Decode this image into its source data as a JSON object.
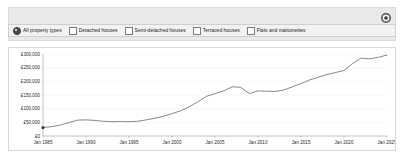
{
  "toolbar": {
    "settings_icon": "gear-icon"
  },
  "filters": {
    "options": [
      {
        "label": "All property types",
        "control": "radio",
        "checked": true
      },
      {
        "label": "Detached houses",
        "control": "checkbox",
        "checked": false
      },
      {
        "label": "Semi-detached houses",
        "control": "checkbox",
        "checked": false
      },
      {
        "label": "Terraced houses",
        "control": "checkbox",
        "checked": false
      },
      {
        "label": "Flats and maisonettes",
        "control": "checkbox",
        "checked": false
      }
    ]
  },
  "colors": {
    "line": "#555555",
    "toolbar_bg": "#e9e9e9",
    "filter_bg": "#f2f2f2",
    "panel_border": "#d8d8d8",
    "grid": "#ededed",
    "axis": "#9a9a9a"
  },
  "chart_data": {
    "type": "line",
    "title": "",
    "xlabel": "",
    "ylabel": "",
    "grid": true,
    "legend": false,
    "ylim": [
      0,
      300000
    ],
    "yticks": [
      0,
      50000,
      100000,
      150000,
      200000,
      250000,
      300000
    ],
    "ytick_labels": [
      "£0",
      "£50,000",
      "£100,000",
      "£150,000",
      "£200,000",
      "£250,000",
      "£300,000"
    ],
    "xlim": [
      "1985-01",
      "2025-01"
    ],
    "xticks": [
      "Jan 1985",
      "Jan 1990",
      "Jan 1995",
      "Jan 2000",
      "Jan 2005",
      "Jan 2010",
      "Jan 2015",
      "Jan 2020",
      "Jan 2025"
    ],
    "series": [
      {
        "name": "All property types",
        "x": [
          "1985",
          "1986",
          "1987",
          "1988",
          "1989",
          "1990",
          "1991",
          "1992",
          "1993",
          "1994",
          "1995",
          "1996",
          "1997",
          "1998",
          "1999",
          "2000",
          "2001",
          "2002",
          "2003",
          "2004",
          "2005",
          "2006",
          "2007",
          "2008",
          "2009",
          "2010",
          "2011",
          "2012",
          "2013",
          "2014",
          "2015",
          "2016",
          "2017",
          "2018",
          "2019",
          "2020",
          "2021",
          "2022",
          "2023",
          "2024",
          "2025"
        ],
        "values": [
          31000,
          34000,
          40000,
          49000,
          58000,
          59000,
          57000,
          54000,
          52000,
          53000,
          52000,
          54000,
          59000,
          65000,
          72000,
          82000,
          92000,
          107000,
          125000,
          145000,
          155000,
          165000,
          180000,
          178000,
          155000,
          165000,
          164000,
          163000,
          168000,
          180000,
          192000,
          205000,
          215000,
          225000,
          232000,
          240000,
          265000,
          285000,
          282000,
          288000,
          296000
        ]
      }
    ]
  }
}
